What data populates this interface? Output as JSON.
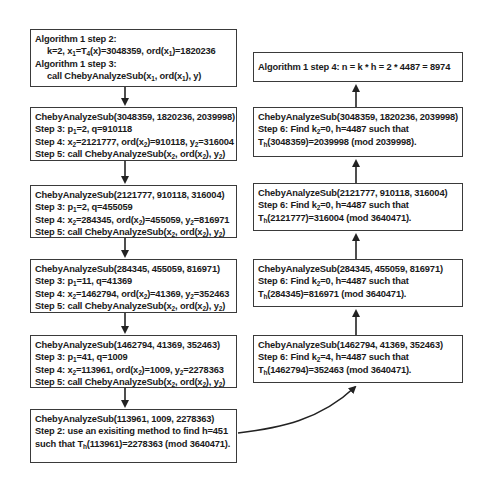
{
  "diagram": {
    "left_column": [
      {
        "id": "alg-step-2-3",
        "lines": [
          {
            "html": "Algorithm 1 step 2:",
            "indent": false
          },
          {
            "html": "k=2, x<sub>1</sub>=T<sub>4</sub>(x)=3048359, ord(x<sub>1</sub>)=1820236",
            "indent": true
          },
          {
            "html": "Algorithm 1 step 3:",
            "indent": false
          },
          {
            "html": "call ChebyAnalyzeSub(x<sub>1</sub>, ord(x<sub>1</sub>), y)",
            "indent": true
          }
        ]
      },
      {
        "id": "sub-3048359",
        "lines": [
          {
            "html": "ChebyAnalyzeSub(3048359, 1820236, 2039998)"
          },
          {
            "html": "Step 3: p<sub>1</sub>=2, q=910118"
          },
          {
            "html": "Step 4: x<sub>2</sub>=2121777, ord(x<sub>2</sub>)=910118, y<sub>2</sub>=316004"
          },
          {
            "html": "Step 5: call ChebyAnalyzeSub(x<sub>2</sub>, ord(x<sub>2</sub>), y<sub>2</sub>)"
          }
        ]
      },
      {
        "id": "sub-2121777",
        "lines": [
          {
            "html": "ChebyAnalyzeSub(2121777, 910118, 316004)"
          },
          {
            "html": "Step 3: p<sub>1</sub>=2, q=455059"
          },
          {
            "html": "Step 4: x<sub>2</sub>=284345, ord(x<sub>2</sub>)=455059, y<sub>2</sub>=816971"
          },
          {
            "html": "Step 5: call ChebyAnalyzeSub(x<sub>2</sub>, ord(x<sub>2</sub>), y<sub>2</sub>)"
          }
        ]
      },
      {
        "id": "sub-284345",
        "lines": [
          {
            "html": "ChebyAnalyzeSub(284345, 455059, 816971)"
          },
          {
            "html": "Step 3: p<sub>1</sub>=11, q=41369"
          },
          {
            "html": "Step 4: x<sub>2</sub>=1462794, ord(x<sub>2</sub>)=41369, y<sub>2</sub>=352463"
          },
          {
            "html": "Step 5: call ChebyAnalyzeSub(x<sub>2</sub>, ord(x<sub>2</sub>), y<sub>2</sub>)"
          }
        ]
      },
      {
        "id": "sub-1462794",
        "lines": [
          {
            "html": "ChebyAnalyzeSub(1462794, 41369, 352463)"
          },
          {
            "html": "Step 3: p<sub>1</sub>=41, q=1009"
          },
          {
            "html": "Step 4: x<sub>2</sub>=113961, ord(x<sub>2</sub>)=1009, y<sub>2</sub>=2278363"
          },
          {
            "html": "Step 5: call ChebyAnalyzeSub(x<sub>2</sub>, ord(x<sub>2</sub>), y<sub>2</sub>)"
          }
        ]
      },
      {
        "id": "sub-113961",
        "lines": [
          {
            "html": "ChebyAnalyzeSub(113961, 1009, 2278363)"
          },
          {
            "html": "Step 2: use an exisiting method to find h=451"
          },
          {
            "html": "such that T<sub>h</sub>(113961)=2278363 (mod 3640471)."
          }
        ]
      }
    ],
    "right_column": [
      {
        "id": "alg-step-4",
        "lines": [
          {
            "html": "Algorithm 1 step 4: n = k * h = 2 * 4487 = 8974"
          }
        ]
      },
      {
        "id": "ret-3048359",
        "lines": [
          {
            "html": "ChebyAnalyzeSub(3048359, 1820236, 2039998)"
          },
          {
            "html": "Step 6: Find k<sub>2</sub>=0, h=4487 such that"
          },
          {
            "html": "T<sub>h</sub>(3048359)=2039998 (mod 2039998)."
          }
        ]
      },
      {
        "id": "ret-2121777",
        "lines": [
          {
            "html": "ChebyAnalyzeSub(2121777, 910118, 316004)"
          },
          {
            "html": "Step 6: Find k<sub>2</sub>=0, h=4487 such that"
          },
          {
            "html": "T<sub>h</sub>(2121777)=316004 (mod 3640471)."
          }
        ]
      },
      {
        "id": "ret-284345",
        "lines": [
          {
            "html": "ChebyAnalyzeSub(284345, 455059, 816971)"
          },
          {
            "html": "Step 6: Find k<sub>2</sub>=0, h=4487 such that"
          },
          {
            "html": "T<sub>h</sub>(284345)=816971 (mod 3640471)."
          }
        ]
      },
      {
        "id": "ret-1462794",
        "lines": [
          {
            "html": "ChebyAnalyzeSub(1462794, 41369, 352463)"
          },
          {
            "html": "Step 6: Find k<sub>2</sub>=4, h=4487 such that"
          },
          {
            "html": "T<sub>h</sub>(1462794)=352463 (mod 3640471)."
          }
        ]
      }
    ]
  },
  "colors": {
    "border": "#3a3a3a",
    "text": "#1a1a1a",
    "background": "#ffffff"
  }
}
